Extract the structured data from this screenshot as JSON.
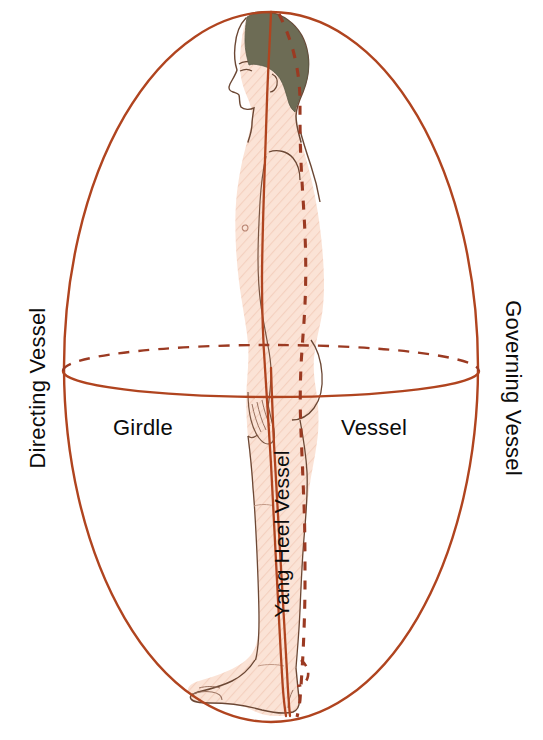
{
  "figure": {
    "labels": {
      "directing_vessel": "Directing  Vessel",
      "governing_vessel": "Governing  Vessel",
      "girdle": "Girdle",
      "girdle_vessel": "Vessel",
      "yang_heel_vessel": "Yang Heel Vessel"
    },
    "colors": {
      "vessel_line": "#b0441f",
      "vessel_dashed": "#9b3a22",
      "body_outline": "#6b4734",
      "skin_fill": "#fbe3d6",
      "skin_hatch": "#f2cdbb",
      "hair_fill": "#6d6c55",
      "label_text": "#0c0c0c",
      "background": "#ffffff"
    },
    "line_styles": {
      "directing_vessel": "solid",
      "governing_vessel": "dashed",
      "girdle_vessel_front": "solid",
      "girdle_vessel_back": "dashed",
      "yang_heel_vessel": "solid"
    },
    "geometry": {
      "canvas": [
        543,
        740
      ],
      "main_ellipse": {
        "cx": 271,
        "cy": 367,
        "rx": 207,
        "ry": 356
      },
      "girdle_ellipse": {
        "cx": 271,
        "cy": 371,
        "rx": 208,
        "ry": 26
      }
    }
  }
}
